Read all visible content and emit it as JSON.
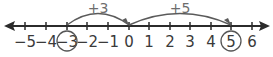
{
  "number_line": {
    "min": -5,
    "max": 6,
    "ticks": [
      {
        "value": -5,
        "label": "−5",
        "x": 25
      },
      {
        "value": -4,
        "label": "−4",
        "x": 46
      },
      {
        "value": -3,
        "label": "−3",
        "x": 67,
        "circled": true
      },
      {
        "value": -2,
        "label": "−2",
        "x": 87
      },
      {
        "value": -1,
        "label": "−1",
        "x": 108
      },
      {
        "value": 0,
        "label": "0",
        "x": 129
      },
      {
        "value": 1,
        "label": "1",
        "x": 149
      },
      {
        "value": 2,
        "label": "2",
        "x": 170
      },
      {
        "value": 3,
        "label": "3",
        "x": 190
      },
      {
        "value": 4,
        "label": "4",
        "x": 211
      },
      {
        "value": 5,
        "label": "5",
        "x": 231,
        "circled": true
      },
      {
        "value": 6,
        "label": "6",
        "x": 252
      }
    ],
    "jumps": [
      {
        "from": -3,
        "to": 0,
        "label": "+3"
      },
      {
        "from": 0,
        "to": 5,
        "label": "+5"
      }
    ],
    "start_value": -3,
    "end_value": 5
  },
  "colors": {
    "axis": "#2b2b2b",
    "arc": "#5a5a5a",
    "labels": "#3a3a3a",
    "circle": "#555555"
  }
}
